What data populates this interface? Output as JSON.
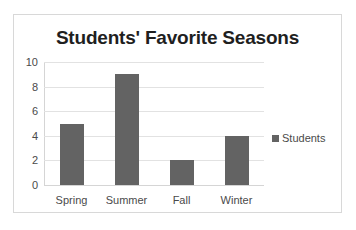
{
  "chart_data": {
    "type": "bar",
    "title": "Students' Favorite Seasons",
    "categories": [
      "Spring",
      "Summer",
      "Fall",
      "Winter"
    ],
    "values": [
      5,
      9,
      2,
      4
    ],
    "series": [
      {
        "name": "Students",
        "values": [
          5,
          9,
          2,
          4
        ]
      }
    ],
    "xlabel": "",
    "ylabel": "",
    "ylim": [
      0,
      10
    ],
    "ytick_step": 2,
    "yticks": [
      0,
      2,
      4,
      6,
      8,
      10
    ],
    "ytick_labels": [
      "0",
      "2",
      "4",
      "6",
      "8",
      "10"
    ],
    "grid": true,
    "grid_axis": "y",
    "legend": {
      "visible": true,
      "position": "right",
      "entries": [
        {
          "label": "Students",
          "color": "#636363",
          "marker": "square"
        }
      ]
    },
    "colors": {
      "bar": "#636363",
      "gridline": "#e2e2e2",
      "axis": "#d5d5d5",
      "title_text": "#1f1f1f",
      "tick_text": "#4a4a4a",
      "frame_border": "#d8d8d8",
      "background": "#ffffff"
    }
  }
}
